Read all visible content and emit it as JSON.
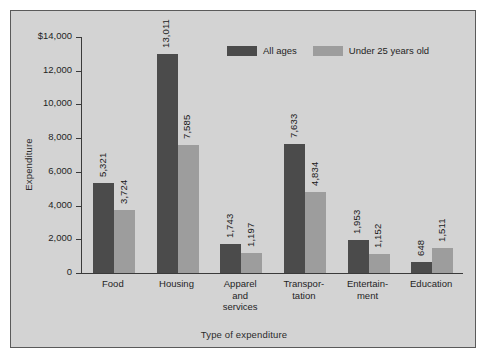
{
  "chart_data": {
    "type": "bar",
    "title": "",
    "xlabel": "Type of expenditure",
    "ylabel": "Expenditure",
    "ylim": [
      0,
      14000
    ],
    "ytick_values": [
      0,
      2000,
      4000,
      6000,
      8000,
      10000,
      12000,
      14000
    ],
    "ytick_labels": [
      "0",
      "2,000",
      "4,000",
      "6,000",
      "8,000",
      "10,000",
      "12,000",
      "$14,000"
    ],
    "grid": false,
    "legend_position": "top-center",
    "categories": [
      "Food",
      "Housing",
      "Apparel and services",
      "Transportation",
      "Entertainment",
      "Education"
    ],
    "category_label_lines": [
      [
        "Food"
      ],
      [
        "Housing"
      ],
      [
        "Apparel",
        "and",
        "services"
      ],
      [
        "Transpor-",
        "tation"
      ],
      [
        "Entertain-",
        "ment"
      ],
      [
        "Education"
      ]
    ],
    "series": [
      {
        "name": "All ages",
        "color": "#4b4b4b",
        "values": [
          5321,
          13011,
          1743,
          7633,
          1953,
          648
        ],
        "labels": [
          "5,321",
          "13,011",
          "1,743",
          "7,633",
          "1,953",
          "648"
        ]
      },
      {
        "name": "Under 25 years old",
        "color": "#9d9d9d",
        "values": [
          3724,
          7585,
          1197,
          4834,
          1152,
          1511
        ],
        "labels": [
          "3,724",
          "7,585",
          "1,197",
          "4,834",
          "1,152",
          "1,511"
        ]
      }
    ]
  },
  "legend": {
    "items": [
      {
        "label": "All ages",
        "color": "#4b4b4b"
      },
      {
        "label": "Under 25 years old",
        "color": "#9d9d9d"
      }
    ]
  },
  "colors": {
    "panel_background": "#d3d3d3",
    "panel_border": "#5a5a5a",
    "axis": "#3a3a3a",
    "series_all_ages": "#4b4b4b",
    "series_under_25": "#9d9d9d",
    "text": "#1f1f1f"
  }
}
